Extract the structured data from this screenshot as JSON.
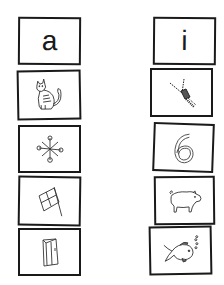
{
  "worksheet": {
    "columns": [
      {
        "header_letter": "a",
        "pictures": [
          {
            "id": "cat",
            "label": "cat-icon"
          },
          {
            "id": "jacks",
            "label": "jacks-icon"
          },
          {
            "id": "flag",
            "label": "flag-icon"
          },
          {
            "id": "bag",
            "label": "bag-icon"
          }
        ]
      },
      {
        "header_letter": "i",
        "pictures": [
          {
            "id": "zipper",
            "label": "zipper-icon"
          },
          {
            "id": "six",
            "label": "number-six-icon",
            "text": "6"
          },
          {
            "id": "pig",
            "label": "pig-icon"
          },
          {
            "id": "fish",
            "label": "fish-icon"
          }
        ]
      }
    ]
  },
  "colors": {
    "ink": "#1a1a1a",
    "background": "#ffffff"
  }
}
